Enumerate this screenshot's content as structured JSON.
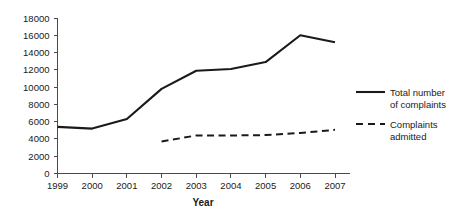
{
  "chart_data": {
    "type": "line",
    "title": "",
    "xlabel": "Year",
    "ylabel": "",
    "categories": [
      "1999",
      "2000",
      "2001",
      "2002",
      "2003",
      "2004",
      "2005",
      "2006",
      "2007"
    ],
    "x": [
      1999,
      2000,
      2001,
      2002,
      2003,
      2004,
      2005,
      2006,
      2007
    ],
    "ylim": [
      0,
      18000
    ],
    "yticks": [
      0,
      2000,
      4000,
      6000,
      8000,
      10000,
      12000,
      14000,
      16000,
      18000
    ],
    "ytick_labels": [
      "0",
      "2000",
      "4000",
      "6000",
      "8000",
      "10000",
      "12000",
      "14000",
      "16000",
      "18000"
    ],
    "grid": false,
    "legend_position": "right",
    "series": [
      {
        "name": "Total number of complaints",
        "style": "solid",
        "color": "#1a1a1a",
        "x": [
          1999,
          2000,
          2001,
          2002,
          2003,
          2004,
          2005,
          2006,
          2007
        ],
        "values": [
          5400,
          5200,
          6300,
          9800,
          11900,
          12100,
          12900,
          16000,
          15200
        ]
      },
      {
        "name": "Complaints admitted",
        "style": "dashed",
        "color": "#1a1a1a",
        "x": [
          2002,
          2003,
          2004,
          2005,
          2006,
          2007
        ],
        "values": [
          3700,
          4400,
          4400,
          4450,
          4700,
          5050
        ]
      }
    ]
  },
  "legend": {
    "entries": [
      {
        "line1": "Total number",
        "line2": "of complaints",
        "style": "solid"
      },
      {
        "line1": "Complaints",
        "line2": "admitted",
        "style": "dashed"
      }
    ]
  },
  "axes": {
    "x_title": "Year"
  }
}
